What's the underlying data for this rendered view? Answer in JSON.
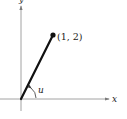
{
  "diagram": {
    "axes": {
      "x_label": "x",
      "y_label": "y",
      "axis_color": "#8a8a8a"
    },
    "vector": {
      "from": [
        0,
        0
      ],
      "to": [
        1,
        2
      ],
      "point_label": "(1, 2)",
      "color": "#111111"
    },
    "angle": {
      "label": "u"
    }
  }
}
